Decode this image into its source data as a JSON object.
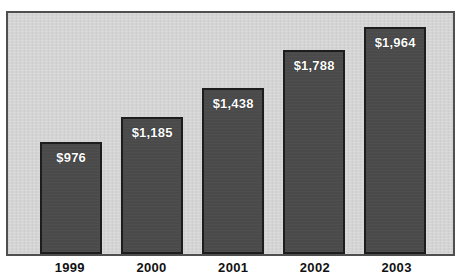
{
  "chart_data": {
    "type": "bar",
    "title": "",
    "subtitle": "",
    "xlabel": "",
    "ylabel": "",
    "categories": [
      "1999",
      "2000",
      "2001",
      "2002",
      "2003"
    ],
    "values": [
      976,
      1185,
      1438,
      1788,
      1964
    ],
    "value_labels": [
      "$976",
      "$1,185",
      "$1,438",
      "$1,788",
      "$1,964"
    ],
    "value_prefix": "$",
    "ylim": [
      0,
      2160
    ],
    "grid": false,
    "legend": null,
    "legend_position": "none",
    "axis_tick_labels_y": [],
    "annotations": [],
    "series": [
      {
        "name": "",
        "values": [
          976,
          1185,
          1438,
          1788,
          1964
        ]
      }
    ]
  },
  "style": {
    "plot_background": "#d2d2d2",
    "bar_fill": "#4a4a4a",
    "bar_border": "#1d1d1d",
    "frame_border": "#4f4f4f",
    "value_label_color": "#ffffff",
    "tick_label_color": "#111111",
    "page_background": "#ffffff"
  },
  "layout": {
    "bar_geometry": [
      {
        "left_pct": 7.2,
        "width_pct": 14.0,
        "height_pct": 46.6
      },
      {
        "left_pct": 25.4,
        "width_pct": 14.0,
        "height_pct": 56.8
      },
      {
        "left_pct": 43.6,
        "width_pct": 14.0,
        "height_pct": 68.7
      },
      {
        "left_pct": 61.8,
        "width_pct": 14.0,
        "height_pct": 84.6
      },
      {
        "left_pct": 80.0,
        "width_pct": 14.0,
        "height_pct": 94.0
      }
    ],
    "tick_geometry": [
      {
        "left_pct": 7.2,
        "width_pct": 14.0
      },
      {
        "left_pct": 25.4,
        "width_pct": 14.0
      },
      {
        "left_pct": 43.6,
        "width_pct": 14.0
      },
      {
        "left_pct": 61.8,
        "width_pct": 14.0
      },
      {
        "left_pct": 80.0,
        "width_pct": 14.0
      }
    ]
  }
}
